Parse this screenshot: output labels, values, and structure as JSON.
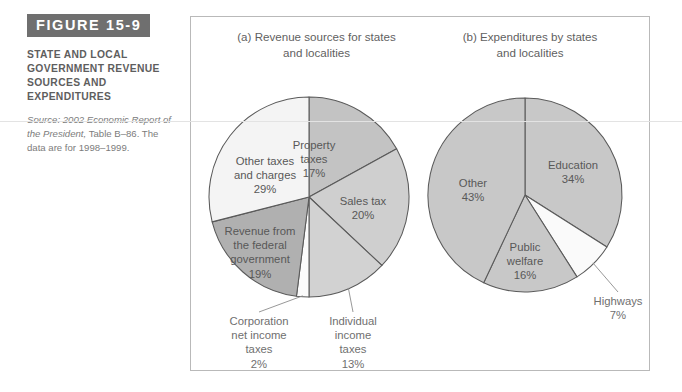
{
  "caption": {
    "badge": "FIGURE 15-9",
    "title": "STATE AND LOCAL GOVERNMENT REVENUE SOURCES AND EXPENDITURES",
    "source_prefix": "Source: 2002 Economic Report of the President,",
    "source_rest": " Table B–86. The data are for 1998–1999."
  },
  "chart_data": [
    {
      "type": "pie",
      "id": "panel-a",
      "title": "(a) Revenue sources for states\nand localities",
      "labels": [
        "Property taxes",
        "Sales tax",
        "Individual income taxes",
        "Corporation net income taxes",
        "Revenue from the federal government",
        "Other taxes and charges"
      ],
      "values": [
        17,
        20,
        13,
        2,
        19,
        29
      ],
      "unit": "%",
      "legend": "none",
      "slices": [
        {
          "name": "Property taxes",
          "value": 17,
          "label_lines": [
            "Property",
            "taxes",
            "17%"
          ],
          "color": "#c3c3c3",
          "placement": "inside",
          "lx": 5,
          "ly": -48
        },
        {
          "name": "Sales tax",
          "value": 20,
          "label_lines": [
            "Sales tax",
            "20%"
          ],
          "color": "#cfcfcf",
          "placement": "inside",
          "lx": 54,
          "ly": 8
        },
        {
          "name": "Individual income taxes",
          "value": 13,
          "label_lines": [
            "Individual",
            "income",
            "taxes",
            "13%"
          ],
          "color": "#d2d2d2",
          "placement": "outside",
          "lx": 44,
          "ly": 128
        },
        {
          "name": "Corporation net income taxes",
          "value": 2,
          "label_lines": [
            "Corporation",
            "net income",
            "taxes",
            "2%"
          ],
          "color": "#fbfbfb",
          "placement": "outside",
          "lx": -50,
          "ly": 128
        },
        {
          "name": "Revenue from the federal government",
          "value": 19,
          "label_lines": [
            "Revenue from",
            "the federal",
            "government",
            "19%"
          ],
          "color": "#b0b0b0",
          "placement": "inside",
          "lx": -49,
          "ly": 38
        },
        {
          "name": "Other taxes and charges",
          "value": 29,
          "label_lines": [
            "Other taxes",
            "and charges",
            "29%"
          ],
          "color": "#f4f4f4",
          "placement": "inside",
          "lx": -44,
          "ly": -32
        }
      ]
    },
    {
      "type": "pie",
      "id": "panel-b",
      "title": "(b) Expenditures by states\nand localities",
      "labels": [
        "Education",
        "Highways",
        "Public welfare",
        "Other"
      ],
      "values": [
        34,
        7,
        16,
        43
      ],
      "unit": "%",
      "legend": "none",
      "slices": [
        {
          "name": "Education",
          "value": 34,
          "label_lines": [
            "Education",
            "34%"
          ],
          "color": "#c8c8c8",
          "placement": "inside",
          "lx": 48,
          "ly": -26
        },
        {
          "name": "Highways",
          "value": 7,
          "label_lines": [
            "Highways",
            "7%"
          ],
          "color": "#fafafa",
          "placement": "outside",
          "lx": 93,
          "ly": 110
        },
        {
          "name": "Public welfare",
          "value": 16,
          "label_lines": [
            "Public",
            "welfare",
            "16%"
          ],
          "color": "#c8c8c8",
          "placement": "inside",
          "lx": 0,
          "ly": 56
        },
        {
          "name": "Other",
          "value": 43,
          "label_lines": [
            "Other",
            "43%"
          ],
          "color": "#c8c8c8",
          "placement": "inside",
          "lx": -52,
          "ly": -8
        }
      ]
    }
  ],
  "geometry": {
    "panel_a": {
      "cx": 113,
      "cy": 110,
      "r": 100
    },
    "panel_b": {
      "cx": 102,
      "cy": 100,
      "r": 97
    }
  }
}
